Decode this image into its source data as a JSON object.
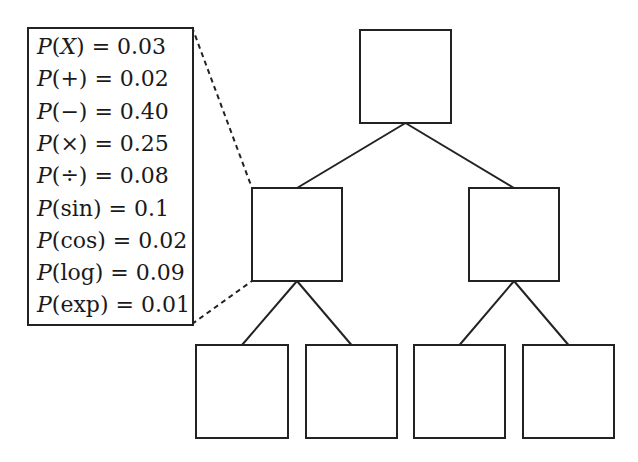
{
  "diagram": {
    "type": "tree",
    "legend": {
      "entries": [
        {
          "symbol": "X",
          "italic": true,
          "prob": "0.03"
        },
        {
          "symbol": "+",
          "italic": false,
          "prob": "0.02"
        },
        {
          "symbol": "−",
          "italic": false,
          "prob": "0.40"
        },
        {
          "symbol": "×",
          "italic": false,
          "prob": "0.25"
        },
        {
          "symbol": "÷",
          "italic": false,
          "prob": "0.08"
        },
        {
          "symbol": "sin",
          "italic": false,
          "prob": "0.1"
        },
        {
          "symbol": "cos",
          "italic": false,
          "prob": "0.02"
        },
        {
          "symbol": "log",
          "italic": false,
          "prob": "0.09"
        },
        {
          "symbol": "exp",
          "italic": false,
          "prob": "0.01"
        }
      ],
      "P_label": "P",
      "equals": "="
    },
    "nodes": [
      {
        "id": "root",
        "x": 360,
        "y": 30,
        "w": 91,
        "h": 93
      },
      {
        "id": "mid-left",
        "x": 252,
        "y": 188,
        "w": 90,
        "h": 93
      },
      {
        "id": "mid-right",
        "x": 469,
        "y": 188,
        "w": 90,
        "h": 93
      },
      {
        "id": "leaf-1",
        "x": 196,
        "y": 345,
        "w": 92,
        "h": 93
      },
      {
        "id": "leaf-2",
        "x": 306,
        "y": 345,
        "w": 91,
        "h": 93
      },
      {
        "id": "leaf-3",
        "x": 414,
        "y": 345,
        "w": 91,
        "h": 93
      },
      {
        "id": "leaf-4",
        "x": 523,
        "y": 345,
        "w": 91,
        "h": 93
      }
    ],
    "edges": [
      {
        "from": "root",
        "to": "mid-left"
      },
      {
        "from": "root",
        "to": "mid-right"
      },
      {
        "from": "mid-left",
        "to": "leaf-1"
      },
      {
        "from": "mid-left",
        "to": "leaf-2"
      },
      {
        "from": "mid-right",
        "to": "leaf-3"
      },
      {
        "from": "mid-right",
        "to": "leaf-4"
      }
    ],
    "callout": {
      "from_node": "mid-left",
      "to": "legend",
      "style": "dashed"
    }
  }
}
